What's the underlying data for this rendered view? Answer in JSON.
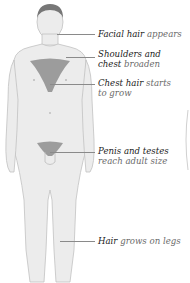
{
  "diagram": {
    "colors": {
      "skin": "#ebebeb",
      "outline": "#c8c8c8",
      "hair": "#8e8e8e",
      "leader": "#8a8a8a"
    },
    "labels": [
      {
        "id": "facial",
        "bold": "Facial hair",
        "light": " appears"
      },
      {
        "id": "shoulders",
        "bold": "Shoulders and",
        "line2_bold": "chest",
        "light2": " broaden"
      },
      {
        "id": "chest",
        "bold": "Chest hair",
        "light": " starts",
        "light2": "to grow"
      },
      {
        "id": "genitals",
        "bold": "Penis and testes",
        "light2": "reach adult size"
      },
      {
        "id": "legs",
        "bold": "Hair",
        "light": " grows on legs"
      }
    ]
  }
}
